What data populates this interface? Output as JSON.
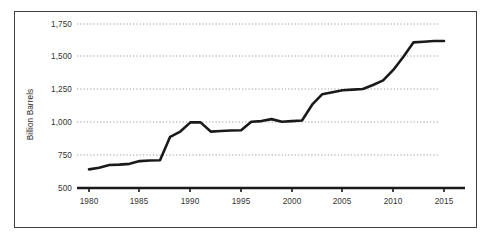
{
  "chart_data": {
    "type": "line",
    "title": "",
    "subtitle": "",
    "xlabel": "",
    "ylabel": "Billion Barrels",
    "xlim": [
      1979,
      2016
    ],
    "ylim": [
      500,
      1750
    ],
    "grid": "horizontal-dotted",
    "legend": "none",
    "y_ticks": [
      500,
      750,
      1000,
      1250,
      1500,
      1750
    ],
    "y_tick_labels": [
      "500",
      "750",
      "1,000",
      "1,250",
      "1,500",
      "1,750"
    ],
    "x_ticks": [
      1980,
      1985,
      1990,
      1995,
      2000,
      2005,
      2010,
      2015
    ],
    "x_tick_labels": [
      "1980",
      "1985",
      "1990",
      "1995",
      "2000",
      "2005",
      "2010",
      "2015"
    ],
    "series": [
      {
        "name": "Proved Reserves",
        "color": "#1a1a1a",
        "x": [
          1980,
          1981,
          1982,
          1983,
          1984,
          1985,
          1986,
          1987,
          1988,
          1989,
          1990,
          1991,
          1992,
          1993,
          1994,
          1995,
          1996,
          1997,
          1998,
          1999,
          2000,
          2001,
          2002,
          2003,
          2004,
          2005,
          2006,
          2007,
          2008,
          2009,
          2010,
          2011,
          2012,
          2013,
          2014,
          2015
        ],
        "values": [
          642,
          655,
          675,
          678,
          684,
          705,
          710,
          712,
          890,
          930,
          1000,
          1000,
          930,
          935,
          938,
          940,
          1005,
          1010,
          1025,
          1005,
          1010,
          1015,
          1135,
          1215,
          1230,
          1245,
          1250,
          1255,
          1285,
          1320,
          1400,
          1500,
          1610,
          1615,
          1620,
          1620
        ]
      }
    ]
  },
  "axis_style": {
    "axis_color": "#1a1a1a",
    "grid_color": "#9a9a9a",
    "frame_color": "#3f3f3f",
    "tick_color": "#1a1a1a"
  }
}
